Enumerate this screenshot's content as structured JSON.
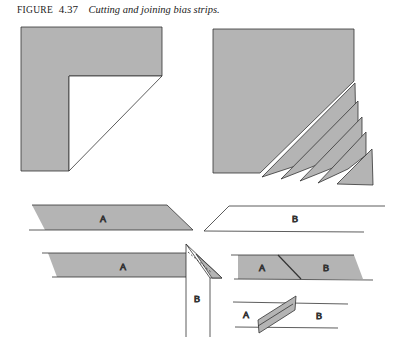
{
  "caption": {
    "label": "FIGURE",
    "number": "4.37",
    "title": "Cutting and joining bias strips."
  },
  "colors": {
    "fabric_fill": "#b4b4b4",
    "stroke": "#333333",
    "background": "#ffffff"
  },
  "panels": [
    {
      "id": "fold-corner",
      "description": "Square of fabric with corner folded diagonally"
    },
    {
      "id": "cut-strips",
      "description": "Square with bias strips cut along the diagonal"
    },
    {
      "id": "strips-separate",
      "labels": [
        "A",
        "B"
      ]
    },
    {
      "id": "strips-overlap",
      "labels": [
        "A",
        "B"
      ]
    },
    {
      "id": "strips-joined",
      "labels": [
        "A",
        "B"
      ]
    },
    {
      "id": "seam-pressed",
      "labels": [
        "A",
        "B"
      ]
    }
  ],
  "labels": {
    "strip_a": "A",
    "strip_b": "B"
  }
}
